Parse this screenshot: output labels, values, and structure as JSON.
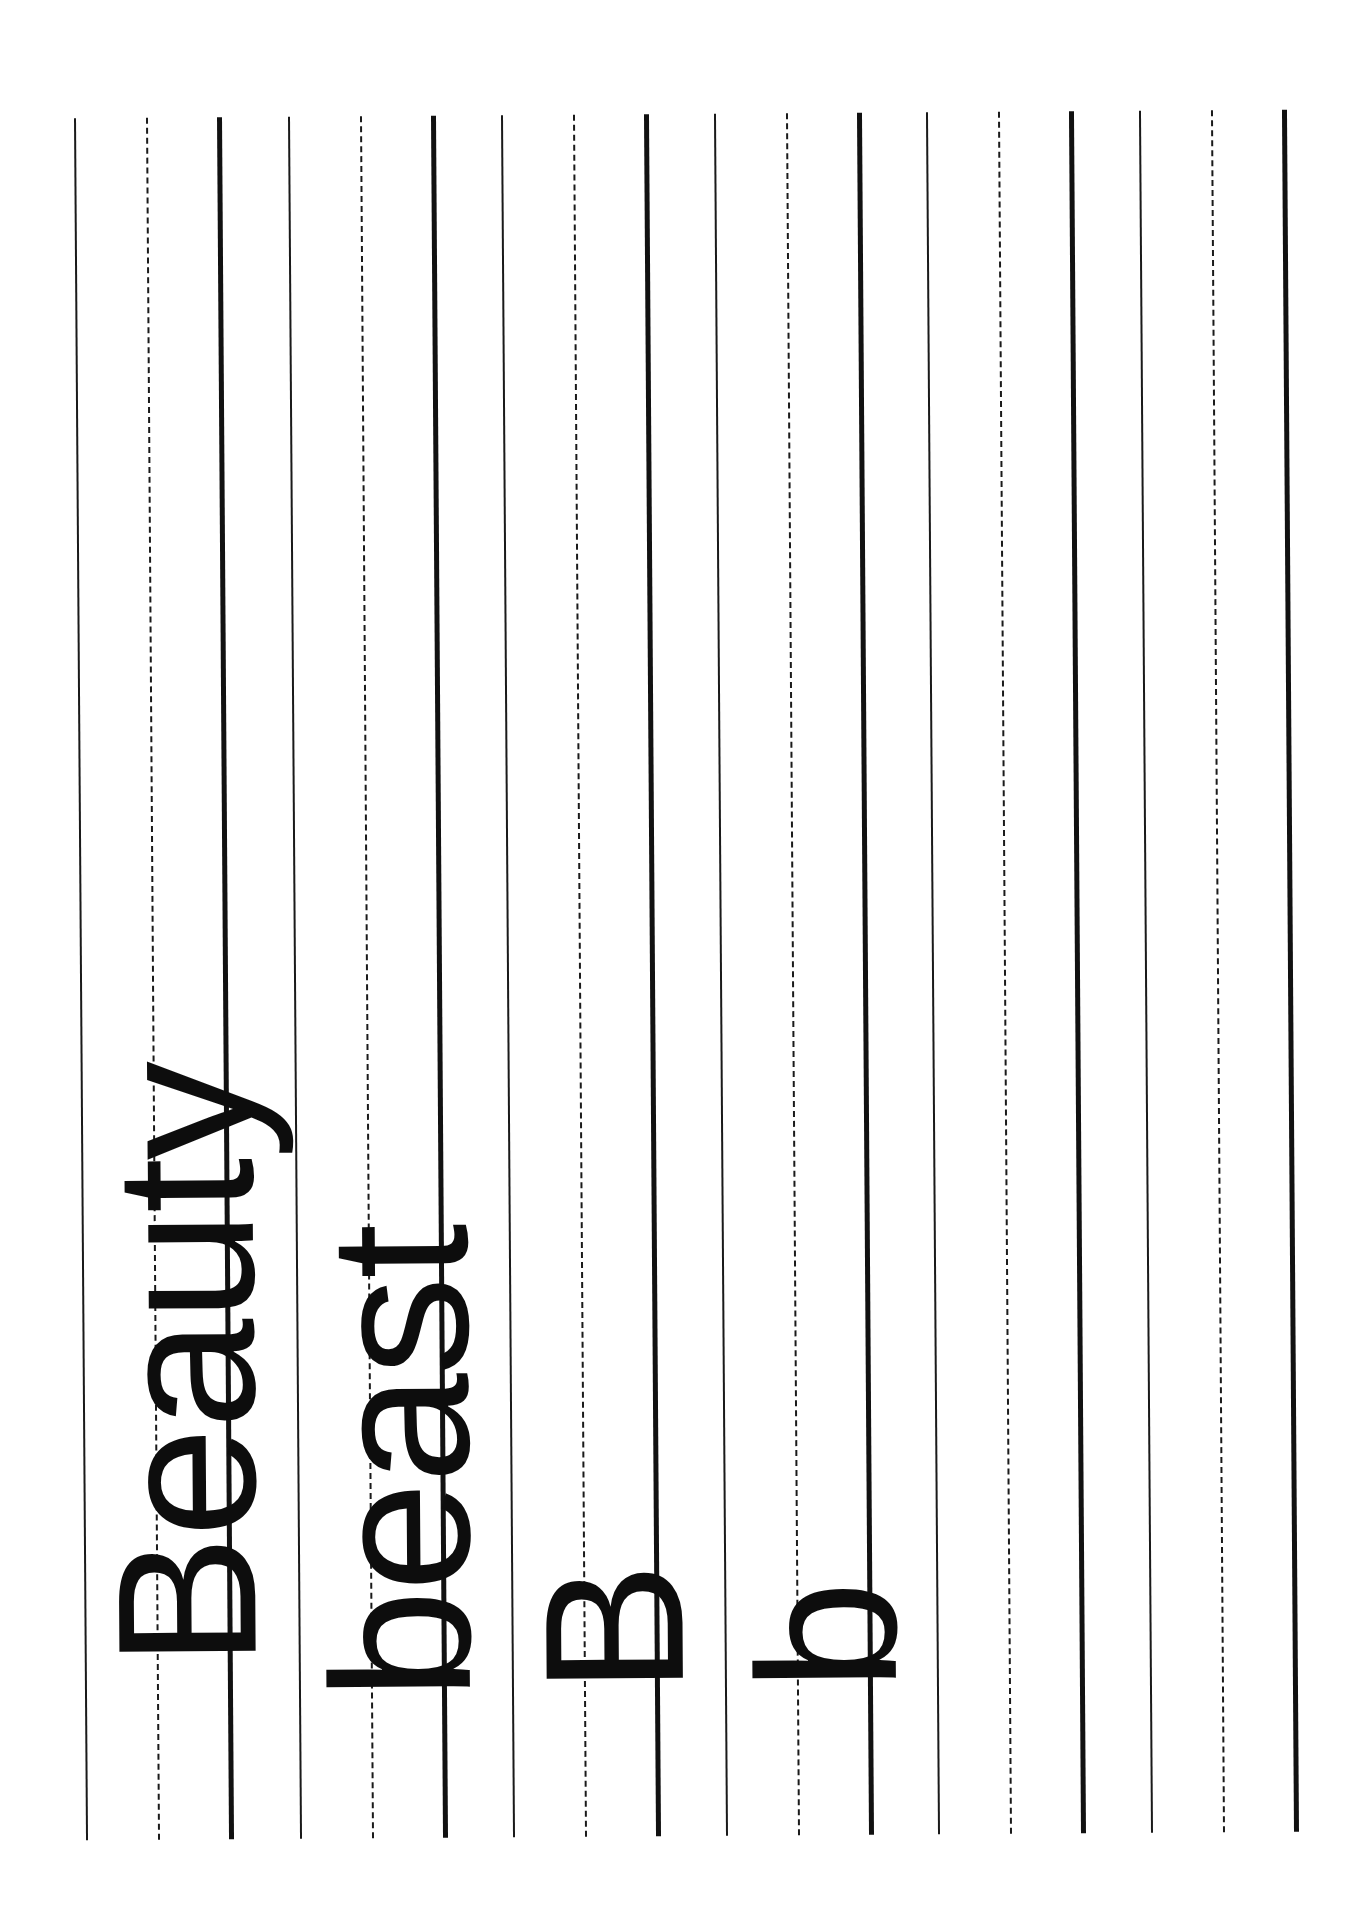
{
  "worksheet": {
    "type": "handwriting practice lines",
    "orientation": "rotated 90 degrees counter-clockwise",
    "line_color": "#111111",
    "groups": [
      {
        "id": 1,
        "left": 80,
        "word": "Beauty",
        "word_start_y": 1660
      },
      {
        "id": 2,
        "left": 294,
        "word": "beast",
        "word_start_y": 1694
      },
      {
        "id": 3,
        "left": 507,
        "word": "B",
        "word_start_y": 1690
      },
      {
        "id": 4,
        "left": 720,
        "word": "b",
        "word_start_y": 1688
      },
      {
        "id": 5,
        "left": 932,
        "word": ""
      },
      {
        "id": 6,
        "left": 1145,
        "word": ""
      }
    ]
  }
}
